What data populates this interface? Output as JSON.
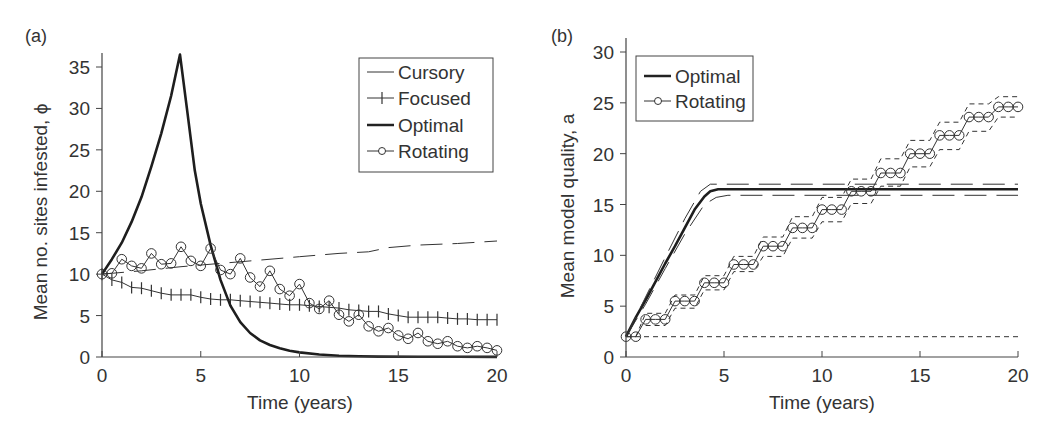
{
  "chart_data": [
    {
      "type": "line",
      "panel_label": "(a)",
      "title": "",
      "xlabel": "Time (years)",
      "ylabel": "Mean no. sites infested, ϕ",
      "xlim": [
        0,
        20
      ],
      "ylim": [
        0,
        35
      ],
      "xticks": [
        0,
        5,
        10,
        15,
        20
      ],
      "yticks": [
        0,
        5,
        10,
        15,
        20,
        25,
        30,
        35
      ],
      "grid": false,
      "legend_position": "upper right",
      "series": [
        {
          "name": "Cursory",
          "style": "thin long-dashed line",
          "x": [
            0,
            2,
            4,
            6,
            8,
            10,
            12,
            13.5,
            14.5,
            16,
            18,
            20
          ],
          "y": [
            10,
            10.4,
            10.9,
            11.3,
            11.7,
            12.1,
            12.5,
            12.7,
            13.2,
            13.5,
            13.7,
            14
          ]
        },
        {
          "name": "Focused",
          "style": "line with plus markers",
          "x": [
            0,
            0.5,
            1,
            1.5,
            2,
            2.5,
            3,
            3.5,
            4,
            4.5,
            5,
            5.5,
            6,
            6.5,
            7,
            7.5,
            8,
            8.5,
            9,
            9.5,
            10,
            10.5,
            11,
            11.5,
            12,
            12.5,
            13,
            13.5,
            14,
            14.5,
            15,
            15.5,
            16,
            16.5,
            17,
            17.5,
            18,
            18.5,
            19,
            19.5,
            20
          ],
          "y": [
            10,
            9.3,
            9.0,
            8.4,
            8.3,
            8.0,
            7.7,
            7.5,
            7.5,
            7.5,
            7.2,
            7.0,
            6.9,
            6.9,
            6.8,
            6.7,
            6.6,
            6.5,
            6.4,
            6.3,
            6.3,
            6.2,
            6.1,
            6.0,
            5.9,
            5.7,
            5.6,
            5.5,
            5.5,
            5.2,
            5.0,
            4.8,
            4.8,
            4.8,
            4.8,
            4.7,
            4.6,
            4.6,
            4.5,
            4.5,
            4.5
          ]
        },
        {
          "name": "Optimal",
          "style": "thick solid line",
          "x": [
            0,
            0.5,
            1,
            1.5,
            2,
            2.5,
            3,
            3.5,
            3.95,
            4.3,
            4.7,
            5,
            5.5,
            6,
            6.5,
            7,
            7.5,
            8,
            8.5,
            9,
            9.5,
            10,
            11,
            12,
            13,
            14,
            16,
            18,
            20
          ],
          "y": [
            10,
            11.8,
            13.8,
            16.3,
            19.3,
            23,
            27,
            31.5,
            36.5,
            30,
            22.5,
            18.5,
            13.5,
            9.3,
            6.2,
            4.2,
            2.9,
            2.0,
            1.45,
            1.05,
            0.75,
            0.55,
            0.3,
            0.15,
            0.08,
            0.05,
            0.03,
            0.02,
            0.01
          ]
        },
        {
          "name": "Rotating",
          "style": "thin line with circle markers",
          "x": [
            0,
            0.5,
            1,
            1.5,
            2,
            2.5,
            3,
            3.5,
            4,
            4.5,
            5,
            5.5,
            6,
            6.5,
            7,
            7.5,
            8,
            8.5,
            9,
            9.5,
            10,
            10.5,
            11,
            11.5,
            12,
            12.5,
            13,
            13.5,
            14,
            14.5,
            15,
            15.5,
            16,
            16.5,
            17,
            17.5,
            18,
            18.5,
            19,
            19.5,
            20
          ],
          "y": [
            10,
            10.1,
            11.8,
            11.0,
            10.7,
            12.5,
            11.2,
            11.3,
            13.3,
            11.6,
            11.0,
            13.1,
            10.5,
            10.0,
            11.9,
            9.6,
            8.5,
            10.4,
            8.2,
            7.4,
            8.8,
            6.5,
            5.8,
            6.8,
            5.1,
            4.3,
            5.1,
            3.7,
            3.1,
            3.5,
            2.6,
            2.2,
            2.9,
            1.9,
            1.6,
            1.9,
            1.3,
            1.1,
            1.3,
            1.1,
            0.8
          ]
        }
      ]
    },
    {
      "type": "line",
      "panel_label": "(b)",
      "title": "",
      "xlabel": "Time (years)",
      "ylabel": "Mean model quality, a",
      "xlim": [
        0,
        20
      ],
      "ylim": [
        0,
        30
      ],
      "xticks": [
        0,
        5,
        10,
        15,
        20
      ],
      "yticks": [
        0,
        5,
        10,
        15,
        20,
        25,
        30
      ],
      "grid": false,
      "legend_position": "upper left",
      "series": [
        {
          "name": "Optimal",
          "style": "thick solid line",
          "x": [
            0,
            0.5,
            1,
            1.5,
            2,
            2.5,
            3,
            3.5,
            4,
            4.3,
            4.7,
            5,
            10,
            15,
            20
          ],
          "y": [
            2,
            3.9,
            5.6,
            7.4,
            9.2,
            10.9,
            12.7,
            14.5,
            15.8,
            16.3,
            16.5,
            16.5,
            16.5,
            16.5,
            16.5
          ]
        },
        {
          "name": "Optimal (upper band)",
          "style": "long-dashed",
          "x": [
            0,
            1,
            2,
            3,
            3.8,
            4.3,
            5,
            20
          ],
          "y": [
            2,
            5.9,
            9.8,
            13.6,
            16.3,
            17.0,
            17.0,
            17.0
          ]
        },
        {
          "name": "Optimal (lower band)",
          "style": "long-dashed",
          "x": [
            0,
            1,
            2,
            3,
            4,
            4.6,
            5.2,
            20
          ],
          "y": [
            2,
            5.2,
            8.7,
            12.1,
            15.0,
            15.7,
            15.9,
            15.9
          ]
        },
        {
          "name": "Rotating",
          "style": "thin line with circle markers",
          "x": [
            0,
            0.5,
            1,
            1.5,
            2,
            2.5,
            3,
            3.5,
            4,
            4.5,
            5,
            5.5,
            6,
            6.5,
            7,
            7.5,
            8,
            8.5,
            9,
            9.5,
            10,
            10.5,
            11,
            11.5,
            12,
            12.5,
            13,
            13.5,
            14,
            14.5,
            15,
            15.5,
            16,
            16.5,
            17,
            17.5,
            18,
            18.5,
            19,
            19.5,
            20
          ],
          "y": [
            2,
            2,
            3.7,
            3.7,
            3.7,
            5.5,
            5.5,
            5.5,
            7.3,
            7.3,
            7.3,
            9.1,
            9.1,
            9.1,
            10.9,
            10.9,
            10.9,
            12.7,
            12.7,
            12.7,
            14.5,
            14.5,
            14.5,
            16.3,
            16.3,
            16.3,
            18.1,
            18.1,
            18.1,
            20,
            20,
            20,
            21.8,
            21.8,
            21.8,
            23.6,
            23.6,
            23.6,
            24.6,
            24.6,
            24.6
          ]
        },
        {
          "name": "Rotating (upper band)",
          "style": "short-dashed",
          "x": [
            0.5,
            1,
            2,
            2.5,
            3.5,
            4,
            5,
            5.5,
            6.5,
            7,
            8,
            8.5,
            9.5,
            10,
            11,
            11.5,
            12.5,
            13,
            14,
            14.5,
            15.5,
            16,
            17,
            17.5,
            18.5,
            19,
            20
          ],
          "y": [
            2,
            4.3,
            4.3,
            6.1,
            6.1,
            8.0,
            8.0,
            9.9,
            9.9,
            11.8,
            11.8,
            13.8,
            13.8,
            15.7,
            15.7,
            17.5,
            17.5,
            19.5,
            19.5,
            21.3,
            21.3,
            23.1,
            23.1,
            24.9,
            24.9,
            25.6,
            25.6
          ]
        },
        {
          "name": "Rotating (lower band)",
          "style": "short-dashed",
          "x": [
            0,
            20
          ],
          "y": [
            2,
            2
          ],
          "steps_x": [
            1,
            2,
            2.5,
            3.5,
            4,
            5,
            5.5,
            6.5,
            7,
            8,
            8.5,
            9.5,
            10,
            11,
            11.5,
            12.5,
            13,
            14,
            14.5,
            15.5,
            16,
            17,
            17.5,
            18.5,
            19,
            20
          ],
          "steps_y": [
            3.1,
            3.1,
            4.8,
            4.8,
            6.6,
            6.6,
            8.4,
            8.4,
            9.9,
            9.9,
            11.7,
            11.7,
            13.3,
            13.3,
            15.1,
            15.1,
            16.8,
            16.8,
            18.7,
            18.7,
            20.4,
            20.4,
            22.2,
            22.2,
            23.6,
            23.6
          ]
        }
      ]
    }
  ],
  "panels": {
    "a": {
      "label": "(a)",
      "xlabel": "Time (years)",
      "ylabel": "Mean no. sites infested, ϕ",
      "legend": [
        "Cursory",
        "Focused",
        "Optimal",
        "Rotating"
      ]
    },
    "b": {
      "label": "(b)",
      "xlabel": "Time (years)",
      "ylabel": "Mean model quality, a",
      "legend": [
        "Optimal",
        "Rotating"
      ]
    }
  }
}
